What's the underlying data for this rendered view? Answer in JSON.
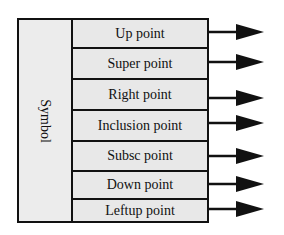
{
  "diagram": {
    "group_label": "Symbol",
    "items": [
      {
        "label": "Up point"
      },
      {
        "label": "Super point"
      },
      {
        "label": "Right point"
      },
      {
        "label": "Inclusion point"
      },
      {
        "label": "Subsc point"
      },
      {
        "label": "Down point"
      },
      {
        "label": "Leftup point"
      }
    ],
    "arrow_icon": "right-arrow-icon",
    "colors": {
      "line": "#111111",
      "fill": "#e8e8e8",
      "background": "#ffffff"
    }
  }
}
